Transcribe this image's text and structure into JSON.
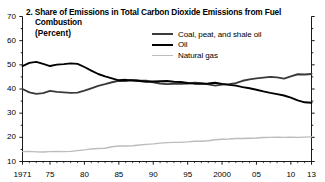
{
  "chart_data": {
    "type": "line",
    "title": "2. Share of Emissions in Total Carbon Dioxide Emissions from Fuel Combustion",
    "title_line1": "2. Share of Emissions in Total Carbon Dioxide Emissions from Fuel",
    "title_line2": "Combustion",
    "subtitle": "(Percent)",
    "xlabel": "",
    "ylabel": "",
    "ylim": [
      10,
      70
    ],
    "yticks": [
      10,
      20,
      30,
      40,
      50,
      60,
      70
    ],
    "ytick_labels": [
      "10",
      "20",
      "30",
      "40",
      "50",
      "60",
      "70"
    ],
    "yminor_step": 5,
    "xlim": [
      1971,
      2013
    ],
    "xticks": [
      1971,
      1975,
      1980,
      1985,
      1990,
      1995,
      2000,
      2005,
      2010,
      2013
    ],
    "xtick_labels": [
      "1971",
      "75",
      "80",
      "85",
      "90",
      "95",
      "2000",
      "05",
      "10",
      "13"
    ],
    "grid": false,
    "legend_position": "top-right",
    "x": [
      1971,
      1972,
      1973,
      1974,
      1975,
      1976,
      1977,
      1978,
      1979,
      1980,
      1981,
      1982,
      1983,
      1984,
      1985,
      1986,
      1987,
      1988,
      1989,
      1990,
      1991,
      1992,
      1993,
      1994,
      1995,
      1996,
      1997,
      1998,
      1999,
      2000,
      2001,
      2002,
      2003,
      2004,
      2005,
      2006,
      2007,
      2008,
      2009,
      2010,
      2011,
      2012,
      2013
    ],
    "series": [
      {
        "name": "Coal, peat, and shale oil",
        "color": "#3a3a3a",
        "values": [
          40.0,
          38.6,
          38.0,
          38.3,
          39.2,
          38.8,
          38.6,
          38.4,
          38.5,
          39.3,
          40.3,
          41.3,
          42.0,
          42.8,
          43.4,
          43.3,
          43.7,
          43.5,
          43.4,
          42.8,
          42.3,
          42.0,
          42.2,
          42.1,
          42.3,
          42.6,
          42.4,
          41.9,
          41.4,
          41.8,
          42.0,
          42.4,
          43.4,
          44.0,
          44.4,
          44.7,
          45.0,
          44.8,
          44.3,
          45.2,
          46.1,
          46.0,
          46.2
        ]
      },
      {
        "name": "Oil",
        "color": "#000000",
        "values": [
          49.5,
          50.8,
          51.2,
          50.4,
          49.5,
          50.1,
          50.3,
          50.6,
          50.4,
          49.1,
          47.6,
          46.2,
          45.2,
          44.4,
          43.6,
          43.8,
          43.5,
          43.3,
          43.0,
          43.1,
          43.2,
          43.3,
          43.0,
          42.9,
          42.5,
          42.2,
          42.2,
          42.3,
          42.6,
          42.1,
          41.7,
          41.4,
          40.8,
          40.3,
          39.7,
          39.0,
          38.4,
          37.9,
          37.3,
          36.4,
          35.3,
          34.5,
          34.3
        ]
      },
      {
        "name": "Natural gas",
        "color": "#bcbcbc",
        "values": [
          14.1,
          14.2,
          14.0,
          13.9,
          14.1,
          14.2,
          14.1,
          14.2,
          14.5,
          14.8,
          15.2,
          15.4,
          15.5,
          16.1,
          16.4,
          16.4,
          16.5,
          16.8,
          17.1,
          17.3,
          17.6,
          17.8,
          17.9,
          17.9,
          18.1,
          18.4,
          18.4,
          18.6,
          19.0,
          19.2,
          19.3,
          19.5,
          19.5,
          19.6,
          19.7,
          19.9,
          20.0,
          20.1,
          20.0,
          20.1,
          20.0,
          20.1,
          20.2
        ]
      }
    ]
  }
}
